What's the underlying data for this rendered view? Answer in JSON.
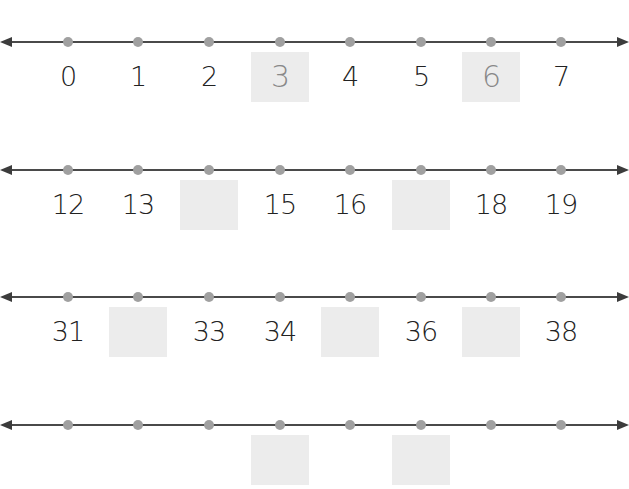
{
  "worksheet": {
    "type": "number-line-fill-in",
    "rows": [
      {
        "cells": [
          {
            "value": "0",
            "box": false,
            "traced": false
          },
          {
            "value": "1",
            "box": false,
            "traced": false
          },
          {
            "value": "2",
            "box": false,
            "traced": false
          },
          {
            "value": "3",
            "box": true,
            "traced": true
          },
          {
            "value": "4",
            "box": false,
            "traced": false
          },
          {
            "value": "5",
            "box": false,
            "traced": false
          },
          {
            "value": "6",
            "box": true,
            "traced": true
          },
          {
            "value": "7",
            "box": false,
            "traced": false
          }
        ]
      },
      {
        "cells": [
          {
            "value": "12",
            "box": false,
            "traced": false
          },
          {
            "value": "13",
            "box": false,
            "traced": false
          },
          {
            "value": "",
            "box": true,
            "traced": false
          },
          {
            "value": "15",
            "box": false,
            "traced": false
          },
          {
            "value": "16",
            "box": false,
            "traced": false
          },
          {
            "value": "",
            "box": true,
            "traced": false
          },
          {
            "value": "18",
            "box": false,
            "traced": false
          },
          {
            "value": "19",
            "box": false,
            "traced": false
          }
        ]
      },
      {
        "cells": [
          {
            "value": "31",
            "box": false,
            "traced": false
          },
          {
            "value": "",
            "box": true,
            "traced": false
          },
          {
            "value": "33",
            "box": false,
            "traced": false
          },
          {
            "value": "34",
            "box": false,
            "traced": false
          },
          {
            "value": "",
            "box": true,
            "traced": false
          },
          {
            "value": "36",
            "box": false,
            "traced": false
          },
          {
            "value": "",
            "box": true,
            "traced": false
          },
          {
            "value": "38",
            "box": false,
            "traced": false
          }
        ]
      },
      {
        "cells": [
          {
            "value": "",
            "box": false,
            "traced": false
          },
          {
            "value": "",
            "box": false,
            "traced": false
          },
          {
            "value": "",
            "box": false,
            "traced": false
          },
          {
            "value": "",
            "box": true,
            "traced": false
          },
          {
            "value": "",
            "box": false,
            "traced": false
          },
          {
            "value": "",
            "box": true,
            "traced": false
          },
          {
            "value": "",
            "box": false,
            "traced": false
          },
          {
            "value": "",
            "box": false,
            "traced": false
          }
        ]
      }
    ]
  },
  "colors": {
    "line": "#4a4a4a",
    "dot": "#a0a0a0",
    "answer_box": "#ececec"
  }
}
